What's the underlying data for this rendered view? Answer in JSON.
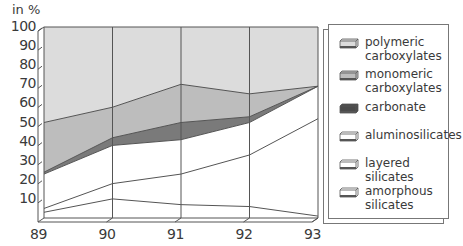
{
  "chart_data": {
    "type": "area",
    "stacked": true,
    "title": "",
    "ylabel": "in %",
    "xlabel": "",
    "x": [
      "89",
      "90",
      "91",
      "92",
      "93"
    ],
    "ylim": [
      0,
      100
    ],
    "yticks": [
      "100",
      "90",
      "80",
      "70",
      "60",
      "50",
      "40",
      "30",
      "20",
      "10"
    ],
    "grid": "vertical lines at each x category",
    "legend_position": "right",
    "boundaries_cumulative": {
      "monomeric_top": [
        50,
        58,
        70,
        65,
        69
      ],
      "carbonate_top": [
        24,
        42,
        50,
        53,
        69
      ],
      "carbonate_bottom": [
        23,
        38,
        41,
        50,
        69
      ],
      "aluminosilicates_bottom": [
        5,
        18,
        23,
        33,
        52
      ],
      "layered_bottom": [
        3,
        10,
        7,
        6,
        1
      ]
    },
    "series": [
      {
        "name": "polymeric carboxylates",
        "values": [
          50,
          42,
          30,
          35,
          31
        ],
        "color": "#dcdcdc"
      },
      {
        "name": "monomeric carboxylates",
        "values": [
          26,
          16,
          20,
          12,
          0
        ],
        "color": "#bdbdbd"
      },
      {
        "name": "carbonate",
        "values": [
          1,
          4,
          9,
          3,
          0
        ],
        "color": "#7a7a7a"
      },
      {
        "name": "aluminosilicates",
        "values": [
          18,
          20,
          18,
          17,
          17
        ],
        "color": "#ffffff"
      },
      {
        "name": "layered silicates",
        "values": [
          2,
          8,
          16,
          27,
          51
        ],
        "color": "#ffffff"
      },
      {
        "name": "amorphous silicates",
        "values": [
          3,
          10,
          7,
          6,
          1
        ],
        "color": "#ffffff"
      }
    ]
  },
  "axis": {
    "unit": "in %",
    "y_labels": [
      "100",
      "90",
      "80",
      "70",
      "60",
      "50",
      "40",
      "30",
      "20",
      "10"
    ],
    "x_labels": [
      "89",
      "90",
      "91",
      "92",
      "93"
    ]
  },
  "legend": {
    "items": [
      {
        "label": "polymeric carboxylates",
        "line1": "polymeric",
        "line2": "carboxylates",
        "color": "#dcdcdc"
      },
      {
        "label": "monomeric carboxylates",
        "line1": "monomeric",
        "line2": "carboxylates",
        "color": "#bdbdbd"
      },
      {
        "label": "carbonate",
        "line1": "carbonate",
        "line2": "",
        "color": "#4a4a4a"
      },
      {
        "label": "aluminosilicates",
        "line1": "aluminosilicates",
        "line2": "",
        "color": "#ffffff"
      },
      {
        "label": "layered silicates",
        "line1": "layered silicates",
        "line2": "",
        "color": "#ffffff"
      },
      {
        "label": "amorphous silicates",
        "line1": "amorphous",
        "line2": "silicates",
        "color": "#ffffff"
      }
    ]
  }
}
